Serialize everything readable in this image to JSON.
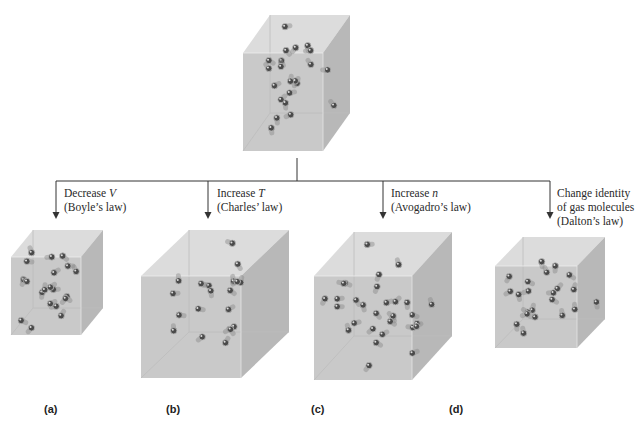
{
  "figure": {
    "top_box": {
      "name": "initial-gas-container"
    },
    "branches": [
      {
        "id": "a",
        "caption": "(a)",
        "line1_pre": "Decrease ",
        "line1_var": "V",
        "line2": "(Boyle’s law)"
      },
      {
        "id": "b",
        "caption": "(b)",
        "line1_pre": "Increase ",
        "line1_var": "T",
        "line2": "(Charles’ law)"
      },
      {
        "id": "c",
        "caption": "(c)",
        "line1_pre": "Increase ",
        "line1_var": "n",
        "line2": "(Avogadro’s law)"
      },
      {
        "id": "d",
        "caption": "(d)",
        "line1": "Change identity",
        "line2": "of gas molecules",
        "line3": "(Dalton’s law)"
      }
    ],
    "colors": {
      "connector": "#333333",
      "cube_front": "#c9c9c9",
      "cube_top": "#dcdcdc",
      "cube_side": "#b8b8b8",
      "molecule": "#4a4a4a"
    }
  }
}
